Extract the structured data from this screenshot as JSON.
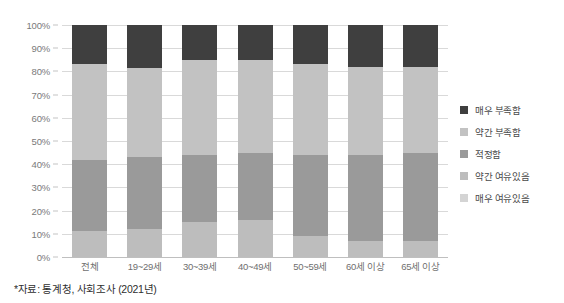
{
  "chart_data": {
    "type": "bar",
    "subtype": "stacked-bar-100-percent",
    "title": "",
    "xlabel": "",
    "ylabel": "",
    "ylim": [
      0,
      100
    ],
    "ytick_labels": [
      "100%",
      "90%",
      "80%",
      "70%",
      "60%",
      "50%",
      "40%",
      "30%",
      "20%",
      "10%",
      "0%"
    ],
    "ytick_values": [
      100,
      90,
      80,
      70,
      60,
      50,
      40,
      30,
      20,
      10,
      0
    ],
    "grid": true,
    "legend_position": "right",
    "categories": [
      "전체",
      "19~29세",
      "30~39세",
      "40~49세",
      "50~59세",
      "60세 이상",
      "65세 이상"
    ],
    "series": [
      {
        "name": "매우 부족함",
        "color": "#3f3f3f",
        "values": [
          17.0,
          18.5,
          15.0,
          15.0,
          17.0,
          18.0,
          18.0
        ]
      },
      {
        "name": "약간 부족함",
        "color": "#c2c2c2",
        "values": [
          41.0,
          38.5,
          41.0,
          40.0,
          39.0,
          38.0,
          37.0
        ]
      },
      {
        "name": "적정함",
        "color": "#9a9a9a",
        "values": [
          31.0,
          31.0,
          29.0,
          29.0,
          35.0,
          37.0,
          38.0
        ]
      },
      {
        "name": "약간 여유있음",
        "color": "#bdbdbd",
        "values": [
          11.0,
          12.0,
          15.0,
          16.0,
          9.0,
          7.0,
          7.0
        ]
      },
      {
        "name": "매우 여유있음",
        "color": "#d4d4d4",
        "values": [
          0.0,
          0.0,
          0.0,
          0.0,
          0.0,
          0.0,
          0.0
        ]
      }
    ]
  },
  "legend": {
    "items": [
      {
        "label": "매우 부족함",
        "color": "#3f3f3f"
      },
      {
        "label": "약간 부족함",
        "color": "#c2c2c2"
      },
      {
        "label": "적정함",
        "color": "#9a9a9a"
      },
      {
        "label": "약간 여유있음",
        "color": "#bdbdbd"
      },
      {
        "label": "매우 여유있음",
        "color": "#d4d4d4"
      }
    ]
  },
  "source": {
    "note": "*자료: 통계청, 사회조사 (2021년)"
  }
}
